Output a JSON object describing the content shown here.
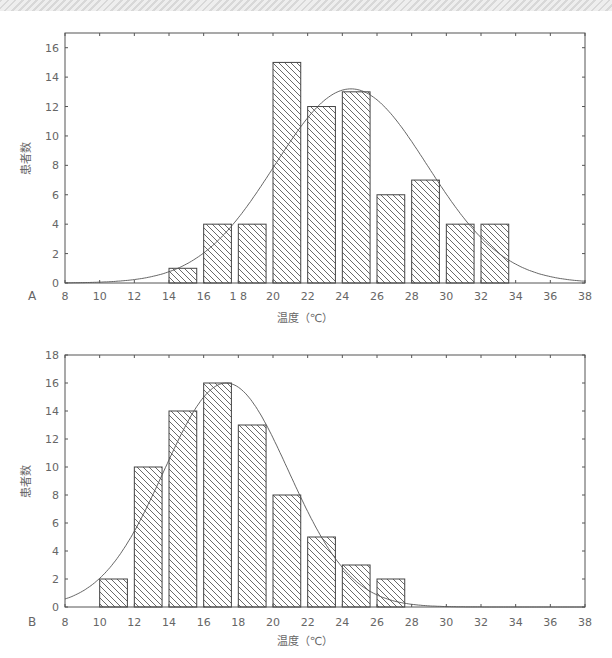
{
  "header": {
    "strip": "decorative-header"
  },
  "chart_data": [
    {
      "type": "bar",
      "panel_label": "A",
      "title": "",
      "xlabel": "温度（℃）",
      "ylabel": "患者数",
      "xlim": [
        8,
        38
      ],
      "ylim": [
        0,
        17
      ],
      "x_ticks": [
        8,
        10,
        12,
        14,
        16,
        18,
        20,
        22,
        24,
        26,
        28,
        30,
        32,
        34,
        36,
        38
      ],
      "x_tick_labels": [
        "8",
        "10",
        "12",
        "14",
        "16",
        "1 8",
        "20",
        "22",
        "24",
        "26",
        "28",
        "30",
        "32",
        "34",
        "36",
        "38"
      ],
      "y_ticks": [
        0,
        2,
        4,
        6,
        8,
        10,
        12,
        14,
        16
      ],
      "bins": [
        [
          14,
          15.6
        ],
        [
          16,
          17.6
        ],
        [
          18,
          19.6
        ],
        [
          20,
          21.6
        ],
        [
          22,
          23.6
        ],
        [
          24,
          25.6
        ],
        [
          26,
          27.6
        ],
        [
          28,
          29.6
        ],
        [
          30,
          31.6
        ],
        [
          32,
          33.6
        ]
      ],
      "categories": [
        "14-16",
        "16-18",
        "18-20",
        "20-22",
        "22-24",
        "24-26",
        "26-28",
        "28-30",
        "30-32",
        "32-34"
      ],
      "values": [
        1,
        4,
        4,
        15,
        12,
        13,
        6,
        7,
        4,
        4
      ],
      "fit_curve": {
        "type": "normal",
        "mean": 24.5,
        "sd": 4.4,
        "peak": 13.2
      },
      "grid": false,
      "hatch": "diagonal"
    },
    {
      "type": "bar",
      "panel_label": "B",
      "title": "",
      "xlabel": "温度（℃）",
      "ylabel": "患者数",
      "xlim": [
        8,
        38
      ],
      "ylim": [
        0,
        18
      ],
      "x_ticks": [
        8,
        10,
        12,
        14,
        16,
        18,
        20,
        22,
        24,
        26,
        28,
        30,
        32,
        34,
        36,
        38
      ],
      "x_tick_labels": [
        "8",
        "10",
        "12",
        "14",
        "16",
        "18",
        "20",
        "22",
        "24",
        "26",
        "28",
        "30",
        "32",
        "34",
        "36",
        "38"
      ],
      "y_ticks": [
        0,
        2,
        4,
        6,
        8,
        10,
        12,
        14,
        16,
        18
      ],
      "bins": [
        [
          10,
          11.6
        ],
        [
          12,
          13.6
        ],
        [
          14,
          15.6
        ],
        [
          16,
          17.6
        ],
        [
          18,
          19.6
        ],
        [
          20,
          21.6
        ],
        [
          22,
          23.6
        ],
        [
          24,
          25.6
        ],
        [
          26,
          27.6
        ]
      ],
      "categories": [
        "10-12",
        "12-14",
        "14-16",
        "16-18",
        "18-20",
        "20-22",
        "22-24",
        "24-26",
        "26-28"
      ],
      "values": [
        2,
        10,
        14,
        16,
        13,
        8,
        5,
        3,
        2
      ],
      "fit_curve": {
        "type": "normal",
        "mean": 17.3,
        "sd": 3.6,
        "peak": 16.0
      },
      "grid": false,
      "hatch": "diagonal"
    }
  ],
  "style": {
    "bar_stroke": "#444444",
    "hatch_color": "#444444",
    "axis_color": "#555555",
    "curve_color": "#555555"
  }
}
